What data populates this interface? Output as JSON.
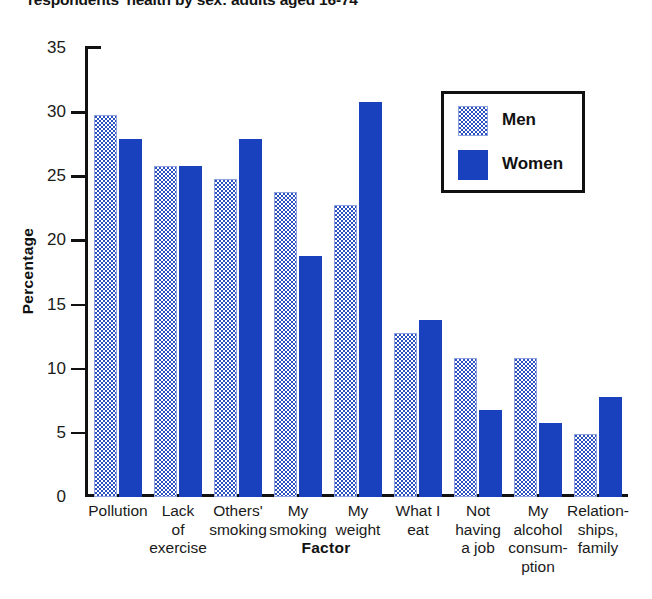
{
  "chart_data": {
    "type": "bar",
    "title": "respondents' health by sex: adults aged 16-74",
    "xlabel": "Factor",
    "ylabel": "Percentage",
    "ylim": [
      0,
      35
    ],
    "yticks": [
      0,
      5,
      10,
      15,
      20,
      25,
      30,
      35
    ],
    "grid": false,
    "legend_position": "top-right",
    "categories": [
      "Pollution",
      "Lack of exercise",
      "Others' smoking",
      "My smoking",
      "My weight",
      "What I eat",
      "Not having a job",
      "My alcohol consumption",
      "Relationships, family"
    ],
    "category_label_lines": [
      [
        "Pollution"
      ],
      [
        "Lack",
        "of",
        "exercise"
      ],
      [
        "Others'",
        "smoking"
      ],
      [
        "My",
        "smoking"
      ],
      [
        "My",
        "weight"
      ],
      [
        "What I",
        "eat"
      ],
      [
        "Not",
        "having",
        "a job"
      ],
      [
        "My",
        "alcohol",
        "consum-",
        "ption"
      ],
      [
        "Relation-",
        "ships,",
        "family"
      ]
    ],
    "series": [
      {
        "name": "Men",
        "color": "#2b50bf",
        "pattern": "dotted",
        "values": [
          29.8,
          25.8,
          24.8,
          23.8,
          22.8,
          12.8,
          10.8,
          10.8,
          4.9
        ]
      },
      {
        "name": "Women",
        "color": "#1940bd",
        "pattern": "solid",
        "values": [
          27.9,
          25.8,
          27.9,
          18.8,
          30.8,
          13.8,
          6.8,
          5.8,
          7.8
        ]
      }
    ]
  },
  "legend": {
    "items": [
      {
        "label": "Men"
      },
      {
        "label": "Women"
      }
    ]
  }
}
